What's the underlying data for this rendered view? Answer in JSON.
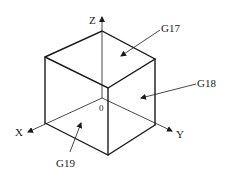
{
  "diagram": {
    "title": "",
    "axes": {
      "x_label": "X",
      "y_label": "Y",
      "z_label": "Z",
      "origin_label": "0"
    },
    "planes": [
      {
        "id": "G17",
        "label": "G17",
        "face": "top (XY plane)"
      },
      {
        "id": "G18",
        "label": "G18",
        "face": "right (ZX plane)"
      },
      {
        "id": "G19",
        "label": "G19",
        "face": "left-bottom (YZ plane)"
      }
    ],
    "colors": {
      "line": "#1a1a1a",
      "background": "#ffffff"
    }
  }
}
